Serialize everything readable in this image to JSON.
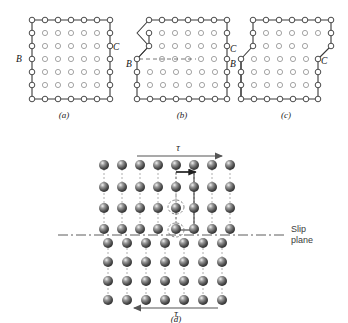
{
  "figure": {
    "panels": [
      {
        "id": "a",
        "label": "(a)",
        "caption_label": "(a)",
        "description": "Perfect crystal before slip; surface points B and C on opposite faces",
        "labels": [
          {
            "text": "B",
            "side": "left"
          },
          {
            "text": "C",
            "side": "right"
          }
        ],
        "lattice": {
          "columns": 7,
          "rows": 7,
          "atom_style": "open-circle"
        }
      },
      {
        "id": "b",
        "label": "(b)",
        "caption_label": "(b)",
        "description": "Dislocation half-way through crystal; step formed at B, slip plane shown dashed",
        "labels": [
          {
            "text": "B",
            "side": "left"
          },
          {
            "text": "C",
            "side": "right"
          }
        ],
        "lattice": {
          "columns": 7,
          "rows": 7,
          "atom_style": "open-circle"
        },
        "slip_line_style": "dashed"
      },
      {
        "id": "c",
        "label": "(c)",
        "caption_label": "(c)",
        "description": "Dislocation has passed completely through; unit step of slip produced at both B and C",
        "labels": [
          {
            "text": "B",
            "side": "left"
          },
          {
            "text": "C",
            "side": "right"
          }
        ],
        "lattice": {
          "columns": 7,
          "rows": 7,
          "atom_style": "open-circle"
        }
      },
      {
        "id": "d",
        "label": "(d)",
        "caption_label": "(d)",
        "description": "Atomic model of edge dislocation moving under shear stress tau; slip plane marked",
        "labels": [
          {
            "text": "τ",
            "position": "top",
            "arrow_direction": "right"
          },
          {
            "text": "τ",
            "position": "bottom",
            "arrow_direction": "left"
          }
        ],
        "annotations": [
          {
            "text": "Slip",
            "name": "slip-plane-label-line1"
          },
          {
            "text": "plane",
            "name": "slip-plane-label-line2"
          }
        ],
        "lattice": {
          "columns_upper": 8,
          "columns_lower": 7,
          "rows_upper": 4,
          "rows_lower": 4,
          "atom_style": "shaded-sphere"
        },
        "burgers_vector": {
          "direction": "right",
          "shown": true
        }
      }
    ],
    "colors": {
      "background": "#ffffff",
      "outline": "#3a3a3a",
      "atom_open_stroke": "#8d8d8d",
      "atom_edge_stroke": "#4a4a4a",
      "sphere_dark": "#4f4f4f",
      "sphere_highlight": "#e8e8e8",
      "arrow": "#555555",
      "text": "#1a1a1a",
      "slip_plane": "#4a4a4a"
    }
  }
}
